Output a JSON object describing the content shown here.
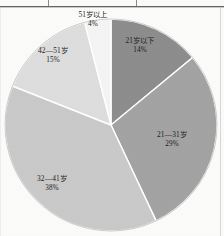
{
  "chart_data": {
    "type": "pie",
    "title": "",
    "xlabel": "",
    "ylabel": "",
    "legend_position": "none",
    "grid": false,
    "labels_inside": true,
    "start_angle_deg": 0,
    "direction": "clockwise",
    "categories": [
      "21岁以下",
      "21—31岁",
      "32—41岁",
      "42—51岁",
      "51岁以上"
    ],
    "values": [
      14,
      29,
      38,
      15,
      4
    ],
    "value_labels": [
      "14%",
      "29%",
      "38%",
      "15%",
      "4%"
    ],
    "colors": [
      "#8d8d8d",
      "#a3a3a3",
      "#c9c9c9",
      "#dddddd",
      "#f4f4f4"
    ],
    "slices": [
      {
        "label": "21岁以下",
        "percent_label": "14%",
        "value": 14,
        "color": "#8d8d8d"
      },
      {
        "label": "21—31岁",
        "percent_label": "29%",
        "value": 29,
        "color": "#a3a3a3"
      },
      {
        "label": "32—41岁",
        "percent_label": "38%",
        "value": 38,
        "color": "#c9c9c9"
      },
      {
        "label": "42—51岁",
        "percent_label": "15%",
        "value": 15,
        "color": "#dddddd"
      },
      {
        "label": "51岁以上",
        "percent_label": "4%",
        "value": 4,
        "color": "#f4f4f4"
      }
    ]
  },
  "figure": {
    "slice_outline_color": "#ffffff",
    "background_color": "#fbfbfa",
    "rule_color": "#4a4a4a"
  }
}
